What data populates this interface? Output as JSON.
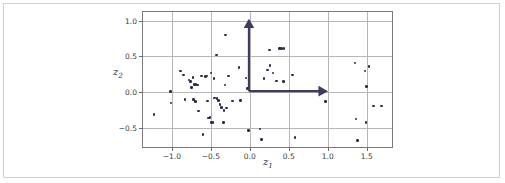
{
  "figure": {
    "background": "#ffffff",
    "border_color": "#cfcfcf",
    "axes_edge_color": "#7a7a7a",
    "grid_color": "#b6b6b6",
    "point_color": "#2b2b4a",
    "arrow_color": "#3b3b63"
  },
  "axis": {
    "xlabel_base": "z",
    "xlabel_sub": "1",
    "ylabel_base": "z",
    "ylabel_sub": "2"
  },
  "chart_data": {
    "type": "scatter",
    "title": "",
    "xlabel": "z_1",
    "ylabel": "z_2",
    "xlim": [
      -1.37,
      1.85
    ],
    "ylim": [
      -0.79,
      1.12
    ],
    "xticks": [
      -1.0,
      -0.5,
      0.0,
      0.5,
      1.0,
      1.5
    ],
    "xticklabels": [
      "-1.0",
      "-0.5",
      "0.0",
      "0.5",
      "1.0",
      "1.5"
    ],
    "yticks": [
      -0.5,
      0.0,
      0.5,
      1.0
    ],
    "yticklabels": [
      "-0.5",
      "0.0",
      "0.5",
      "1.0"
    ],
    "grid": true,
    "legend": null,
    "marker": "point",
    "marker_size": 2.6,
    "points": [
      [
        -1.23,
        -0.31
      ],
      [
        -1.02,
        0.01
      ],
      [
        -1.01,
        -0.15
      ],
      [
        -0.89,
        0.3
      ],
      [
        -0.85,
        0.24
      ],
      [
        -0.83,
        -0.1
      ],
      [
        -0.78,
        0.17
      ],
      [
        -0.76,
        0.15
      ],
      [
        -0.75,
        0.07
      ],
      [
        -0.73,
        0.21
      ],
      [
        -0.72,
        -0.1
      ],
      [
        -0.71,
        0.11
      ],
      [
        -0.7,
        -0.13
      ],
      [
        -0.69,
        0.11
      ],
      [
        -0.67,
        0.1
      ],
      [
        -0.66,
        -0.26
      ],
      [
        -0.62,
        0.23
      ],
      [
        -0.6,
        -0.59
      ],
      [
        -0.57,
        0.22
      ],
      [
        -0.55,
        0.23
      ],
      [
        -0.54,
        -0.12
      ],
      [
        -0.53,
        -0.36
      ],
      [
        -0.51,
        -0.35
      ],
      [
        -0.5,
        0.27
      ],
      [
        -0.49,
        -0.42
      ],
      [
        -0.47,
        -0.42
      ],
      [
        -0.46,
        0.19
      ],
      [
        -0.45,
        -0.08
      ],
      [
        -0.43,
        0.52
      ],
      [
        -0.42,
        -0.09
      ],
      [
        -0.4,
        -0.11
      ],
      [
        -0.38,
        -0.17
      ],
      [
        -0.36,
        -0.21
      ],
      [
        -0.34,
        -0.42
      ],
      [
        -0.33,
        -0.25
      ],
      [
        -0.32,
        0.1
      ],
      [
        -0.31,
        0.8
      ],
      [
        -0.3,
        -0.22
      ],
      [
        -0.27,
        0.23
      ],
      [
        -0.22,
        -0.12
      ],
      [
        -0.14,
        0.35
      ],
      [
        -0.12,
        -0.11
      ],
      [
        -0.05,
        0.2
      ],
      [
        -0.03,
        0.05
      ],
      [
        -0.02,
        -0.53
      ],
      [
        0.09,
        0.02
      ],
      [
        0.13,
        -0.51
      ],
      [
        0.15,
        -0.66
      ],
      [
        0.18,
        0.19
      ],
      [
        0.23,
        0.31
      ],
      [
        0.25,
        0.59
      ],
      [
        0.26,
        0.37
      ],
      [
        0.3,
        0.27
      ],
      [
        0.34,
        0.16
      ],
      [
        0.38,
        0.61
      ],
      [
        0.41,
        0.61
      ],
      [
        0.43,
        0.15
      ],
      [
        0.44,
        0.61
      ],
      [
        0.55,
        0.24
      ],
      [
        0.58,
        -0.63
      ],
      [
        0.97,
        -0.13
      ],
      [
        1.35,
        0.41
      ],
      [
        1.36,
        -0.37
      ],
      [
        1.38,
        -0.67
      ],
      [
        1.48,
        0.3
      ],
      [
        1.49,
        -0.42
      ],
      [
        1.5,
        0.08
      ],
      [
        1.53,
        0.36
      ],
      [
        1.59,
        -0.19
      ],
      [
        1.69,
        -0.19
      ]
    ],
    "annotations": [
      {
        "kind": "arrow",
        "name": "basis-vector-horizontal",
        "from": [
          0.0,
          0.0
        ],
        "to": [
          1.0,
          0.0
        ],
        "color": "#3b3b63"
      },
      {
        "kind": "arrow",
        "name": "basis-vector-vertical",
        "from": [
          0.0,
          0.0
        ],
        "to": [
          0.0,
          1.0
        ],
        "color": "#3b3b63"
      }
    ]
  }
}
